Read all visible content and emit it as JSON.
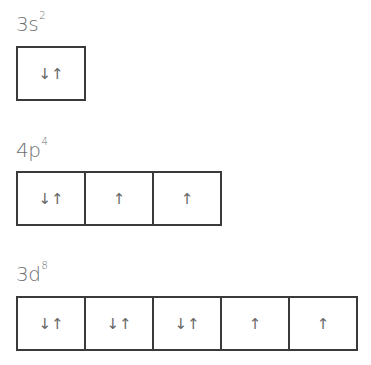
{
  "orbitals": [
    {
      "label_main": "3s",
      "label_sup": "2",
      "boxes": [
        "↓↑"
      ]
    },
    {
      "label_main": "4p",
      "label_sup": "4",
      "boxes": [
        "↓↑",
        "↑",
        "↑"
      ]
    },
    {
      "label_main": "3d",
      "label_sup": "8",
      "boxes": [
        "↓↑",
        "↓↑",
        "↓↑",
        "↑",
        "↑"
      ]
    }
  ]
}
